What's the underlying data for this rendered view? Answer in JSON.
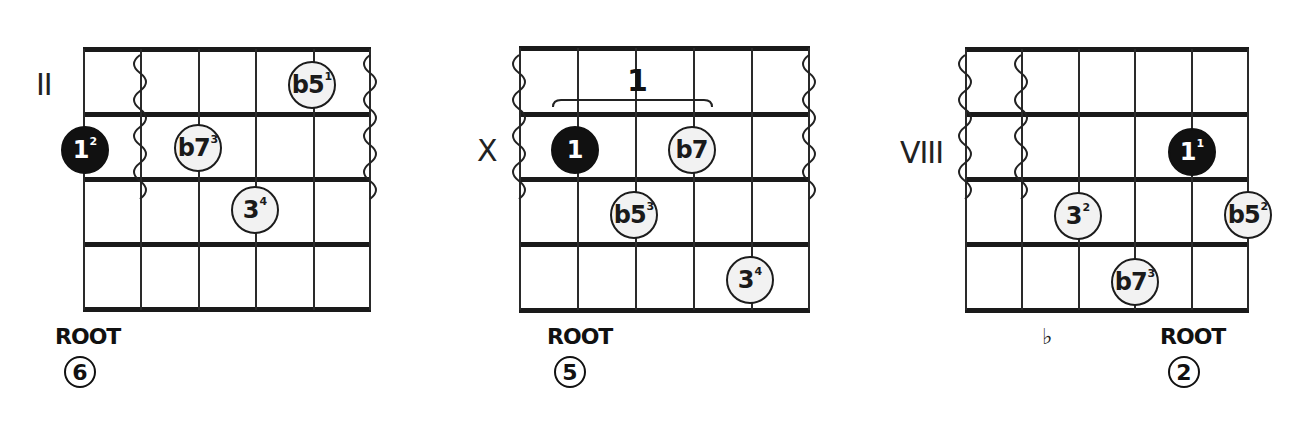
{
  "diagrams": [
    {
      "id": "chord-1",
      "position_label": "II",
      "root_label": "ROOT",
      "root_string": "6",
      "notes": [
        {
          "degree": "1",
          "finger": "2",
          "type": "root"
        },
        {
          "degree": "b7",
          "finger": "3",
          "type": "open"
        },
        {
          "degree": "3",
          "finger": "4",
          "type": "open"
        },
        {
          "degree": "b5",
          "finger": "1",
          "type": "open"
        }
      ]
    },
    {
      "id": "chord-2",
      "position_label": "X",
      "root_label": "ROOT",
      "root_string": "5",
      "barre_finger": "1",
      "notes": [
        {
          "degree": "1",
          "finger": "",
          "type": "root"
        },
        {
          "degree": "b7",
          "finger": "",
          "type": "open"
        },
        {
          "degree": "b5",
          "finger": "3",
          "type": "open"
        },
        {
          "degree": "3",
          "finger": "4",
          "type": "open"
        }
      ]
    },
    {
      "id": "chord-3",
      "position_label": "VIII",
      "root_label": "ROOT",
      "root_string": "2",
      "flat_mark": "♭",
      "notes": [
        {
          "degree": "1",
          "finger": "1",
          "type": "root"
        },
        {
          "degree": "3",
          "finger": "2",
          "type": "open"
        },
        {
          "degree": "b5",
          "finger": "2",
          "type": "open"
        },
        {
          "degree": "b7",
          "finger": "3",
          "type": "open"
        }
      ]
    }
  ],
  "colors": {
    "line": "#1a1a1a",
    "root_fill": "#111111",
    "note_fill": "#f2f2f2",
    "background": "#ffffff"
  }
}
